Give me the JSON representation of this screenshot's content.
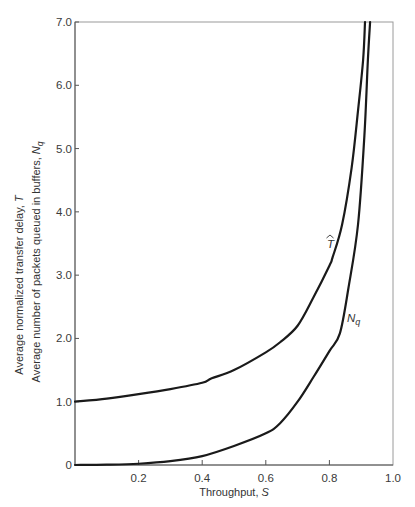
{
  "chart_data": {
    "type": "line",
    "title": "",
    "xlabel": "Throughput, S",
    "ylabel": [
      "Average normalized transfer delay, T̂",
      "Average number of packets queued in buffers, N_q"
    ],
    "xlim": [
      0,
      1.0
    ],
    "ylim": [
      0,
      7.0
    ],
    "grid": false,
    "legend": "none (curves labeled inline)",
    "x_ticks": [
      "0.2",
      "0.4",
      "0.6",
      "0.8",
      "1.0"
    ],
    "y_ticks": [
      "0",
      "1.0",
      "2.0",
      "3.0",
      "4.0",
      "5.0",
      "6.0",
      "7.0"
    ],
    "series": [
      {
        "name": "T̂",
        "label": "T",
        "x": [
          0.0,
          0.1,
          0.2,
          0.3,
          0.4,
          0.43,
          0.5,
          0.6,
          0.645,
          0.7,
          0.75,
          0.8,
          0.81,
          0.84,
          0.87,
          0.89,
          0.906,
          0.912
        ],
        "y": [
          1.0,
          1.05,
          1.12,
          1.2,
          1.3,
          1.37,
          1.5,
          1.78,
          1.94,
          2.2,
          2.65,
          3.15,
          3.28,
          3.8,
          4.7,
          5.6,
          6.4,
          7.0
        ]
      },
      {
        "name": "N_q",
        "label": "N",
        "label_sub": "q",
        "x": [
          0.0,
          0.1,
          0.2,
          0.3,
          0.4,
          0.5,
          0.6,
          0.645,
          0.7,
          0.75,
          0.8,
          0.833,
          0.86,
          0.89,
          0.91,
          0.921,
          0.928
        ],
        "y": [
          0.0,
          0.005,
          0.02,
          0.06,
          0.14,
          0.3,
          0.5,
          0.66,
          1.0,
          1.39,
          1.8,
          2.08,
          2.8,
          3.8,
          5.2,
          6.4,
          7.0
        ]
      }
    ]
  },
  "labels": {
    "x_axis_title": "Throughput,",
    "x_axis_var": "S",
    "y_axis_title_1": "Average normalized transfer delay,",
    "y_axis_var_1": "T",
    "y_axis_title_2": "Average number of packets queued in buffers,",
    "y_axis_var_2": "N",
    "y_axis_var_2_sub": "q",
    "curve_t": "T",
    "curve_nq": "N",
    "curve_nq_sub": "q"
  }
}
